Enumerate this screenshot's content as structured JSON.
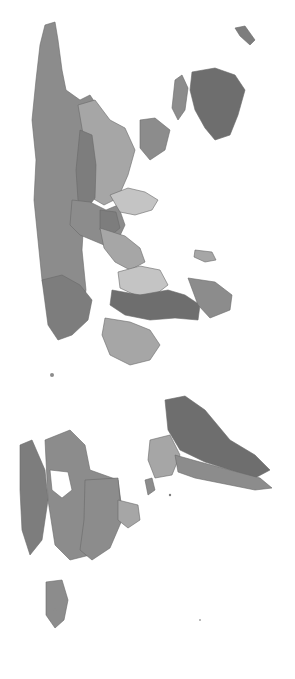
{
  "map": {
    "type": "choropleth",
    "projection": "world map rotated 90 degrees (north to the left)",
    "colors": {
      "background": "#ffffff",
      "dark": "#6e6e6e",
      "mid_dark": "#7d7d7d",
      "mid": "#8c8c8c",
      "light": "#a6a6a6",
      "lightest": "#c4c4c4",
      "border": "#6a6a6a"
    },
    "regions": [
      {
        "name": "russia",
        "shade": "mid"
      },
      {
        "name": "kazakhstan-central-asia",
        "shade": "light"
      },
      {
        "name": "china",
        "shade": "mid"
      },
      {
        "name": "mongolia",
        "shade": "mid_dark"
      },
      {
        "name": "india",
        "shade": "lightest"
      },
      {
        "name": "southeast-asia",
        "shade": "mid_dark"
      },
      {
        "name": "japan",
        "shade": "mid"
      },
      {
        "name": "indonesia",
        "shade": "mid"
      },
      {
        "name": "australia",
        "shade": "dark"
      },
      {
        "name": "middle-east",
        "shade": "light"
      },
      {
        "name": "europe",
        "shade": "mid_dark"
      },
      {
        "name": "north-africa",
        "shade": "lightest"
      },
      {
        "name": "central-africa",
        "shade": "dark"
      },
      {
        "name": "southern-africa",
        "shade": "light"
      },
      {
        "name": "madagascar",
        "shade": "light"
      },
      {
        "name": "canada",
        "shade": "mid"
      },
      {
        "name": "greenland",
        "shade": "dark"
      },
      {
        "name": "usa",
        "shade": "mid"
      },
      {
        "name": "mexico",
        "shade": "mid"
      },
      {
        "name": "central-america",
        "shade": "light"
      },
      {
        "name": "brazil",
        "shade": "dark"
      },
      {
        "name": "andean-south-america",
        "shade": "light"
      },
      {
        "name": "argentina-chile",
        "shade": "mid"
      }
    ]
  }
}
